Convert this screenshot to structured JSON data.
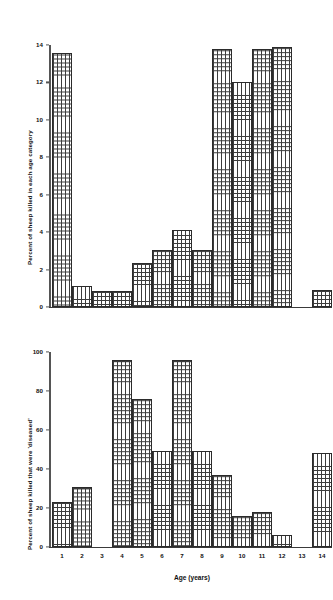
{
  "chart_data": [
    {
      "id": "top",
      "type": "bar",
      "title": "",
      "xlabel": "",
      "ylabel": "Percent of sheep killed in each age category",
      "categories": [
        "1",
        "2",
        "3",
        "4",
        "5",
        "6",
        "7",
        "8",
        "9",
        "10",
        "11",
        "12",
        "13",
        "14"
      ],
      "values": [
        13.6,
        1.1,
        0.85,
        0.85,
        2.35,
        3.05,
        4.1,
        3.05,
        13.8,
        12.0,
        13.8,
        13.9,
        0,
        0.9
      ],
      "ylim": [
        0,
        14
      ],
      "yticks": [
        0,
        2,
        4,
        6,
        8,
        10,
        12,
        14
      ],
      "ytick_labels": [
        "0",
        "2",
        "4",
        "6",
        "8",
        "10",
        "12",
        "14"
      ],
      "xtick_labels": [],
      "grid": false,
      "legend": false
    },
    {
      "id": "bottom",
      "type": "bar",
      "title": "",
      "xlabel": "Age (years)",
      "ylabel": "Percent of sheep killed that were 'diseased'",
      "categories": [
        "1",
        "2",
        "3",
        "4",
        "5",
        "6",
        "7",
        "8",
        "9",
        "10",
        "11",
        "12",
        "13",
        "14"
      ],
      "values": [
        23,
        31,
        0,
        96,
        76,
        49,
        96,
        49,
        37,
        16,
        18,
        6,
        0,
        48
      ],
      "ylim": [
        0,
        100
      ],
      "yticks": [
        0,
        20,
        40,
        60,
        80,
        100
      ],
      "ytick_labels": [
        "0",
        "20",
        "40",
        "60",
        "80",
        "100"
      ],
      "xtick_labels": [
        "1",
        "2",
        "3",
        "4",
        "5",
        "6",
        "7",
        "8",
        "9",
        "10",
        "11",
        "12",
        "13",
        "14"
      ],
      "grid": false,
      "legend": false
    }
  ],
  "style": {
    "bar_edge_color": "#2b2b2b",
    "bar_hatch_color": "#3d3d3d",
    "bar_face_color": "#ffffff",
    "axis_color": "#555555",
    "text_color": "#111111",
    "background": "#ffffff"
  }
}
